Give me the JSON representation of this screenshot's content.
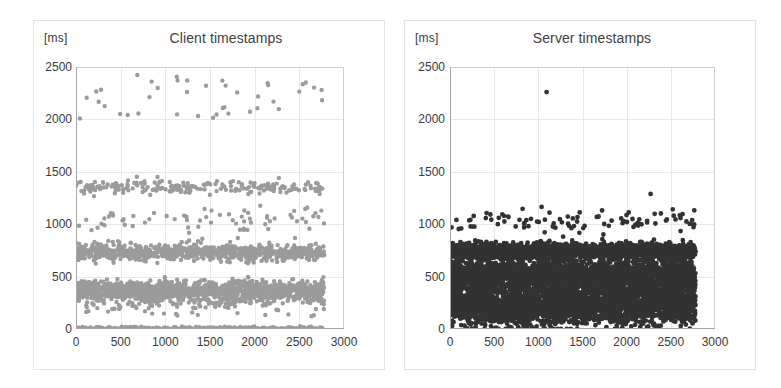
{
  "figure": {
    "background": "#ffffff",
    "panel_border_color": "#e3e3e3"
  },
  "charts": [
    {
      "id": "client",
      "unit_label": "[ms]",
      "title": "Client timestamps",
      "point_color": "#8a8a8a",
      "x_ticks": [
        "0",
        "500",
        "1000",
        "1500",
        "2000",
        "2500",
        "3000"
      ],
      "y_ticks": [
        "2500",
        "2000",
        "1500",
        "1000",
        "500",
        "0"
      ]
    },
    {
      "id": "server",
      "unit_label": "[ms]",
      "title": "Server timestamps",
      "point_color": "#1c1c1c",
      "x_ticks": [
        "0",
        "500",
        "1000",
        "1500",
        "2000",
        "2500",
        "3000"
      ],
      "y_ticks": [
        "2500",
        "2000",
        "1500",
        "1000",
        "500",
        "0"
      ]
    }
  ],
  "chart_data": [
    {
      "type": "scatter",
      "id": "client",
      "title": "Client timestamps",
      "xlabel": "",
      "ylabel": "[ms]",
      "xlim": [
        0,
        3000
      ],
      "ylim": [
        0,
        2500
      ],
      "xticks": [
        0,
        500,
        1000,
        1500,
        2000,
        2500,
        3000
      ],
      "yticks": [
        0,
        500,
        1000,
        1500,
        2000,
        2500
      ],
      "grid": true,
      "legend": null,
      "marker_color": "#8a8a8a",
      "marker_size": 2.2,
      "x_data_range": [
        0,
        2780
      ],
      "clusters": [
        {
          "name": "zero-baseline",
          "center_y": 5,
          "spread_y": 8,
          "density": 0.2,
          "n": 330,
          "note": "sparse dotted line along y=0"
        },
        {
          "name": "low-band",
          "center_y": 365,
          "spread_y": 45,
          "density": 1.0,
          "n": 1350,
          "note": "dense continuous band near 350-400 ms"
        },
        {
          "name": "low-band-scatter",
          "center_y": 255,
          "spread_y": 60,
          "density": 0.18,
          "n": 150
        },
        {
          "name": "mid-band",
          "center_y": 735,
          "spread_y": 38,
          "density": 0.75,
          "n": 820,
          "note": "dense band near 700-780 ms"
        },
        {
          "name": "one-second-scatter",
          "center_y": 1035,
          "spread_y": 70,
          "density": 0.08,
          "n": 70
        },
        {
          "name": "one-point-three-band",
          "center_y": 1350,
          "spread_y": 32,
          "density": 0.22,
          "n": 200
        },
        {
          "name": "outliers-2000",
          "center_y": 2080,
          "spread_y": 60,
          "density": 0.02,
          "n": 18
        },
        {
          "name": "outliers-2300",
          "center_y": 2310,
          "spread_y": 55,
          "density": 0.02,
          "n": 22
        },
        {
          "name": "outliers-2500",
          "center_y": 2470,
          "spread_y": 40,
          "density": 0.004,
          "n": 3
        }
      ]
    },
    {
      "type": "scatter",
      "id": "server",
      "title": "Server timestamps",
      "xlabel": "",
      "ylabel": "[ms]",
      "xlim": [
        0,
        3000
      ],
      "ylim": [
        0,
        2500
      ],
      "xticks": [
        0,
        500,
        1000,
        1500,
        2000,
        2500,
        3000
      ],
      "yticks": [
        0,
        500,
        1000,
        1500,
        2000,
        2500
      ],
      "grid": true,
      "legend": null,
      "marker_color": "#1c1c1c",
      "marker_size": 2.4,
      "x_data_range": [
        0,
        2780
      ],
      "clusters": [
        {
          "name": "band-low",
          "center_y": 230,
          "spread_y": 95,
          "density": 1.0,
          "n": 2600,
          "note": "thick dense band 130-330 ms"
        },
        {
          "name": "band-mid",
          "center_y": 510,
          "spread_y": 85,
          "density": 1.0,
          "n": 2500,
          "note": "thick dense band 420-600 ms"
        },
        {
          "name": "band-high",
          "center_y": 745,
          "spread_y": 35,
          "density": 1.0,
          "n": 1600,
          "note": "dense band 710-790 ms"
        },
        {
          "name": "one-second-scatter",
          "center_y": 1020,
          "spread_y": 55,
          "density": 0.07,
          "n": 95
        },
        {
          "name": "outlier-1290",
          "center_y": 1290,
          "spread_y": 6,
          "density": 0.001,
          "n": 1
        },
        {
          "name": "outlier-2270",
          "center_y": 2270,
          "spread_y": 6,
          "density": 0.001,
          "n": 1
        },
        {
          "name": "outlier-low-100",
          "center_y": 100,
          "spread_y": 15,
          "density": 0.002,
          "n": 2
        }
      ]
    }
  ]
}
